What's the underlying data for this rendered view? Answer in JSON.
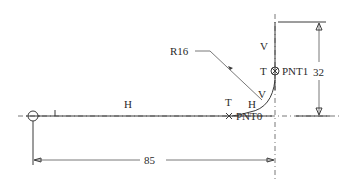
{
  "drawing": {
    "labels": {
      "radius": "R16",
      "v_top": "V",
      "t_top": "T",
      "pnt1": "PNT1",
      "dim_vertical": "32",
      "v_arc": "V",
      "h_arc": "H",
      "t_bottom": "T",
      "pnt0": "PNT0",
      "i_label": "I",
      "h_line": "H",
      "dim_horizontal": "85"
    },
    "dimensions": {
      "horizontal_length": 85,
      "vertical_height": 32,
      "radius": 16
    },
    "points": [
      {
        "name": "PNT0",
        "type": "cross"
      },
      {
        "name": "PNT1",
        "type": "circle-cross"
      }
    ],
    "colors": {
      "line": "#3a3a3a",
      "background": "#ffffff"
    }
  }
}
